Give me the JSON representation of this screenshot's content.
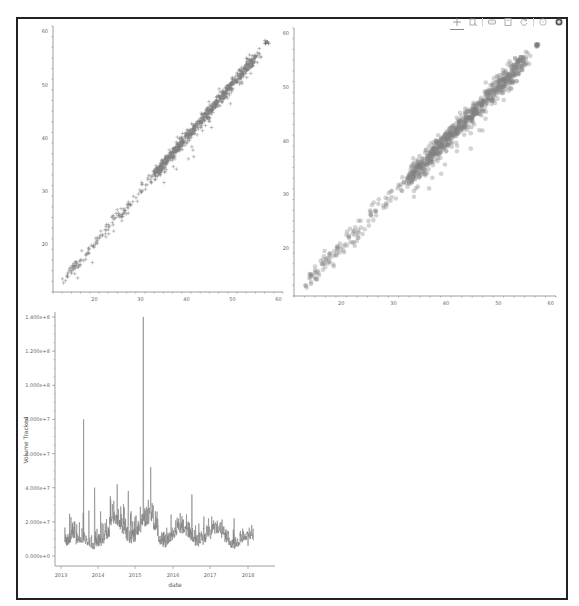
{
  "toolbar": {
    "tools": [
      {
        "name": "pan-tool",
        "icon": "pan-icon",
        "active": true
      },
      {
        "name": "box-zoom-tool",
        "icon": "box-zoom-icon",
        "active": false
      },
      {
        "name": "wheel-zoom-tool",
        "icon": "wheel-zoom-icon",
        "active": false
      },
      {
        "name": "save-tool",
        "icon": "save-icon",
        "active": false
      },
      {
        "name": "reset-tool",
        "icon": "reset-icon",
        "active": false
      },
      {
        "name": "help-tool",
        "icon": "help-icon",
        "active": false
      },
      {
        "name": "bokeh-logo",
        "icon": "bokeh-logo-icon",
        "active": false
      }
    ]
  },
  "chart_data": [
    {
      "type": "scatter",
      "id": "scatter-cross",
      "marker": "cross",
      "title": "",
      "xlabel": "",
      "ylabel": "",
      "xlim": [
        11,
        61
      ],
      "ylim": [
        11,
        61
      ],
      "x_ticks": [
        "20",
        "30",
        "40",
        "50",
        "60"
      ],
      "y_ticks": [
        "20",
        "30",
        "40",
        "50",
        "60"
      ],
      "color": "#808080",
      "trend": {
        "x": [
          13,
          58
        ],
        "y": [
          13,
          58
        ]
      },
      "points_description": "dense points along y = x from about 13 to 58, with a few outliers below the line"
    },
    {
      "type": "scatter",
      "id": "scatter-circle",
      "marker": "circle",
      "alpha": 0.5,
      "title": "",
      "xlabel": "",
      "ylabel": "",
      "xlim": [
        11,
        61
      ],
      "ylim": [
        11,
        61
      ],
      "x_ticks": [
        "20",
        "30",
        "40",
        "50",
        "60"
      ],
      "y_ticks": [
        "20",
        "30",
        "40",
        "50",
        "60"
      ],
      "color": "#808080",
      "trend": {
        "x": [
          13,
          58
        ],
        "y": [
          13,
          58
        ]
      },
      "points_description": "dense semi-transparent circles along y = x from about 13 to 58"
    },
    {
      "type": "line",
      "id": "volume-timeseries",
      "title": "",
      "xlabel": "date",
      "ylabel": "Volume Tracked",
      "x_ticks": [
        "2013",
        "2014",
        "2015",
        "2016",
        "2017",
        "2018"
      ],
      "y_ticks": [
        "0.000e+0",
        "2.000e+7",
        "4.000e+7",
        "6.000e+7",
        "8.000e+7",
        "1.000e+8",
        "1.200e+8",
        "1.400e+8"
      ],
      "ylim": [
        0,
        145000000
      ],
      "color": "#808080",
      "x": [
        "2013.0",
        "2013.5",
        "2013.6",
        "2013.8",
        "2013.9",
        "2014.2",
        "2014.5",
        "2014.8",
        "2015.0",
        "2015.2",
        "2015.4",
        "2015.6",
        "2016.0",
        "2016.5",
        "2017.0",
        "2017.5",
        "2018.0"
      ],
      "values": [
        32000000,
        8000000,
        80000000,
        6000000,
        40000000,
        15000000,
        42000000,
        38000000,
        16000000,
        140000000,
        52000000,
        18000000,
        12000000,
        36000000,
        10000000,
        8000000,
        6000000
      ],
      "notes": "daily volume with baseline ~5e6–1.5e7, peaks ~8e7 mid-2013 and ~1.4e8 early 2015"
    }
  ]
}
